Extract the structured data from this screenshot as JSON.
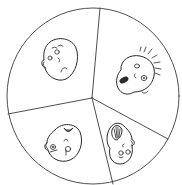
{
  "diagram": {
    "type": "divided-circle",
    "sectors": [
      {
        "position": "top-left",
        "emotion": "sad"
      },
      {
        "position": "right",
        "emotion": "scared"
      },
      {
        "position": "bottom-left",
        "emotion": "angry"
      },
      {
        "position": "bottom-right",
        "emotion": "laughing"
      }
    ],
    "colors": {
      "stroke": "#3a3a3a",
      "background": "#ffffff"
    }
  }
}
